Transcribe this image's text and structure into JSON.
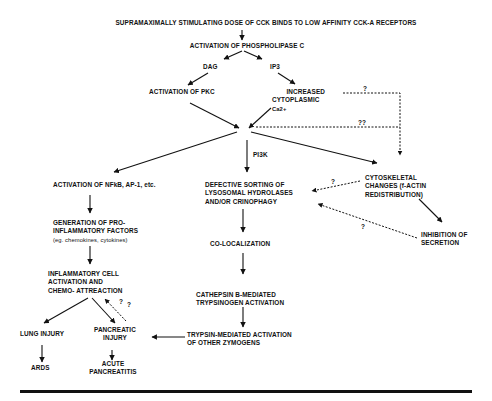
{
  "diagram": {
    "type": "flowchart",
    "title": "",
    "nodes": {
      "top": {
        "lines": [
          "SUPRAMAXIMALLY STIMULATING DOSE OF CCK BINDS TO LOW AFFINITY CCK-A RECEPTORS"
        ]
      },
      "plc": {
        "lines": [
          "ACTIVATION OF  PHOSPHOLIPASE C"
        ]
      },
      "dag": {
        "lines": [
          "DAG"
        ]
      },
      "ip3": {
        "lines": [
          "IP3"
        ]
      },
      "pkc": {
        "lines": [
          "ACTIVATION OF  PKC"
        ]
      },
      "ca": {
        "lines": [
          "INCREASED",
          "CYTOPLASMIC",
          "Ca2+"
        ]
      },
      "nfkb": {
        "lines": [
          "ACTIVATION OF NFkB, AP-1, etc."
        ]
      },
      "defective": {
        "lines": [
          "DEFECTIVE SORTING OF",
          "LYSOSOMAL HYDROLASES",
          "AND/OR CRINOPHAGY"
        ]
      },
      "cytoskeletal": {
        "lines": [
          "CYTOSKELETAL",
          "CHANGES (f-ACTIN",
          "REDISTRIBUTION)"
        ]
      },
      "inhibition": {
        "lines": [
          "INHIBITION OF",
          "SECRETION"
        ]
      },
      "proinflam": {
        "lines": [
          "GENERATION OF  PRO-",
          "INFLAMMATORY FACTORS"
        ],
        "note": "(eg. chemokines, cytokines)"
      },
      "colocal": {
        "lines": [
          "CO-LOCALIZATION"
        ]
      },
      "inflamcell": {
        "lines": [
          "INFLAMMATORY CELL",
          "ACTIVATION AND",
          "CHEMO- ATTREACTION"
        ]
      },
      "cathepsin": {
        "lines": [
          "CATHEPSIN B-MEDIATED",
          "TRYPSINOGEN ACTIVATION"
        ]
      },
      "lung": {
        "lines": [
          "LUNG INJURY"
        ]
      },
      "pancinj": {
        "lines": [
          "PANCREATIC",
          "INJURY"
        ]
      },
      "trypsin": {
        "lines": [
          "TRYPSIN-MEDIATED ACTIVATION",
          "OF OTHER ZYMOGENS"
        ]
      },
      "ards": {
        "lines": [
          "ARDS"
        ]
      },
      "acute": {
        "lines": [
          "ACUTE",
          "PANCREATITIS"
        ]
      }
    },
    "edge_labels": {
      "pi3k": "PI3K",
      "q_ca_cyto": "?",
      "q_hub_cyto": "??",
      "q_cyto_def": "?",
      "q_inhib_def": "?",
      "q_panc_inflam_1": "?",
      "q_panc_inflam_2": "?"
    },
    "edges": [
      {
        "from": "top",
        "to": "plc",
        "style": "solid"
      },
      {
        "from": "plc",
        "to": "dag",
        "style": "solid"
      },
      {
        "from": "plc",
        "to": "ip3",
        "style": "solid"
      },
      {
        "from": "dag",
        "to": "pkc",
        "style": "solid"
      },
      {
        "from": "ip3",
        "to": "ca",
        "style": "solid"
      },
      {
        "from": "pkc",
        "to": "hub",
        "style": "solid"
      },
      {
        "from": "ca",
        "to": "hub",
        "style": "solid"
      },
      {
        "from": "ca",
        "to": "cytoskeletal",
        "style": "dashed",
        "label": "?"
      },
      {
        "from": "hub",
        "to": "cytoskeletal",
        "style": "dashed",
        "label": "??"
      },
      {
        "from": "hub",
        "to": "nfkb",
        "style": "solid"
      },
      {
        "from": "hub",
        "to": "defective",
        "style": "solid",
        "label": "PI3K"
      },
      {
        "from": "hub",
        "to": "cytoskeletal",
        "style": "solid"
      },
      {
        "from": "cytoskeletal",
        "to": "defective",
        "style": "dashed",
        "label": "?"
      },
      {
        "from": "cytoskeletal",
        "to": "inhibition",
        "style": "solid"
      },
      {
        "from": "inhibition",
        "to": "defective",
        "style": "dashed",
        "label": "?"
      },
      {
        "from": "nfkb",
        "to": "proinflam",
        "style": "solid"
      },
      {
        "from": "proinflam",
        "to": "inflamcell",
        "style": "solid"
      },
      {
        "from": "inflamcell",
        "to": "lung",
        "style": "solid"
      },
      {
        "from": "inflamcell",
        "to": "pancinj",
        "style": "solid"
      },
      {
        "from": "pancinj",
        "to": "inflamcell",
        "style": "dashed",
        "label": "? ?"
      },
      {
        "from": "defective",
        "to": "colocal",
        "style": "solid"
      },
      {
        "from": "colocal",
        "to": "cathepsin",
        "style": "solid"
      },
      {
        "from": "cathepsin",
        "to": "trypsin",
        "style": "solid"
      },
      {
        "from": "trypsin",
        "to": "pancinj",
        "style": "solid"
      },
      {
        "from": "lung",
        "to": "ards",
        "style": "solid"
      },
      {
        "from": "pancinj",
        "to": "acute",
        "style": "solid"
      }
    ]
  }
}
